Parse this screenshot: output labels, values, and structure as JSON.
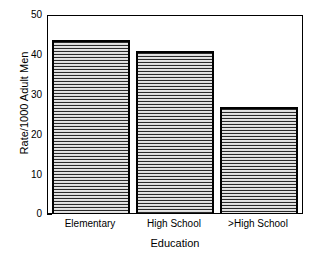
{
  "chart_data": {
    "type": "bar",
    "title": "",
    "subtitle": "",
    "categories": [
      "Elementary",
      "High School",
      ">High School"
    ],
    "values": [
      44,
      41,
      27
    ],
    "series": [
      {
        "name": "Rate/1000 Adult Men",
        "values": [
          44,
          41,
          27
        ]
      }
    ],
    "xlabel": "Education",
    "ylabel": "Rate/1000 Adult Men",
    "ylim": [
      0,
      50
    ],
    "yticks": [
      0,
      10,
      20,
      30,
      40,
      50
    ],
    "ytick_labels": [
      "0",
      "10",
      "20",
      "30",
      "40",
      "50"
    ],
    "grid": false,
    "legend": null,
    "annotations": [],
    "style": {
      "bar_fill": "#d8d8d8",
      "bar_hatch": "horizontal-lines",
      "bar_edge_color": "#000000",
      "frame_color": "#000000",
      "background": "#ffffff",
      "text_color": "#000000"
    }
  }
}
